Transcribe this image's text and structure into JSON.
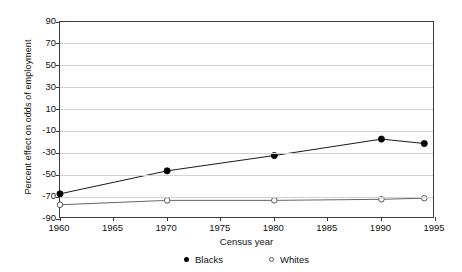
{
  "chart_data": {
    "type": "line",
    "title": "",
    "xlabel": "Census year",
    "ylabel": "Percent effect on odds of employment",
    "x": [
      1960,
      1970,
      1980,
      1990,
      1994
    ],
    "xlim": [
      1960,
      1995
    ],
    "ylim": [
      -90,
      90
    ],
    "xticks": [
      1960,
      1965,
      1970,
      1975,
      1980,
      1985,
      1990,
      1995
    ],
    "yticks": [
      90,
      70,
      50,
      30,
      10,
      -10,
      -30,
      -50,
      -70,
      -90
    ],
    "grid": "horizontal",
    "legend_position": "bottom",
    "series": [
      {
        "name": "Blacks",
        "marker": "filled-circle",
        "color": "#000000",
        "values": [
          -67,
          -46,
          -32,
          -17,
          -21
        ]
      },
      {
        "name": "Whites",
        "marker": "open-circle",
        "color": "#555555",
        "values": [
          -77,
          -73,
          -73,
          -72,
          -71
        ]
      }
    ]
  },
  "axes": {
    "y_title": "Percent effect on odds of employment",
    "x_title": "Census year",
    "y_tick_labels": [
      "90",
      "70",
      "50",
      "30",
      "10",
      "-10",
      "-30",
      "-50",
      "-70",
      "-90"
    ],
    "x_tick_labels": [
      "1960",
      "1965",
      "1970",
      "1975",
      "1980",
      "1985",
      "1990",
      "1995"
    ]
  },
  "legend": {
    "entries": [
      {
        "label": "Blacks",
        "marker": "filled-circle"
      },
      {
        "label": "Whites",
        "marker": "open-circle"
      }
    ]
  },
  "colors": {
    "grid": "#d2d2d2",
    "frame": "#3b3b3b",
    "blacks": "#000000",
    "whites": "#555555",
    "background": "#ffffff"
  }
}
